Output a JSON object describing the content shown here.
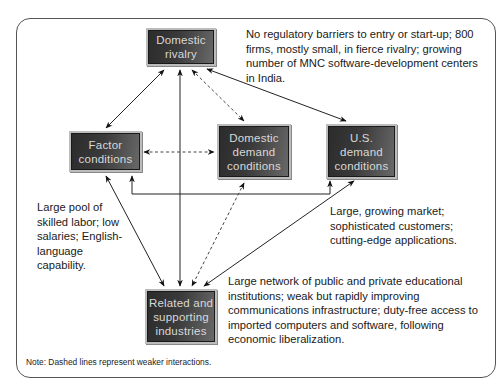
{
  "diagram": {
    "nodes": {
      "domestic_rivalry": "Domestic rivalry",
      "factor_conditions": "Factor conditions",
      "domestic_demand": "Domestic demand conditions",
      "us_demand": "U.S. demand conditions",
      "related_supporting": "Related and supporting industries"
    },
    "notes": {
      "rivalry": "No regulatory barriers to entry or start-up; 800 firms, mostly small, in fierce rivalry; growing number of MNC software-development centers in India.",
      "factor": "Large pool of skilled labor; low salaries; English-language capability.",
      "us_demand": "Large, growing market; sophisticated customers; cutting-edge applications.",
      "related": "Large network of public and private educational institutions; weak but rapidly improving communications infrastructure; duty-free access to imported computers and software, following economic liberalization."
    },
    "footnote": "Note: Dashed lines represent weaker interactions.",
    "edges": [
      {
        "from": "Domestic rivalry",
        "to": "Factor conditions",
        "style": "solid",
        "bidirectional": true
      },
      {
        "from": "Domestic rivalry",
        "to": "Related and supporting industries",
        "style": "solid",
        "bidirectional": true
      },
      {
        "from": "Domestic rivalry",
        "to": "Domestic demand conditions",
        "style": "dashed",
        "bidirectional": true
      },
      {
        "from": "Domestic rivalry",
        "to": "U.S. demand conditions",
        "style": "solid",
        "bidirectional": true
      },
      {
        "from": "Factor conditions",
        "to": "Domestic demand conditions",
        "style": "dashed",
        "bidirectional": true
      },
      {
        "from": "Factor conditions",
        "to": "U.S. demand conditions",
        "style": "solid",
        "bidirectional": true
      },
      {
        "from": "Factor conditions",
        "to": "Related and supporting industries",
        "style": "solid",
        "bidirectional": true
      },
      {
        "from": "Domestic demand conditions",
        "to": "Related and supporting industries",
        "style": "dashed",
        "bidirectional": true
      },
      {
        "from": "U.S. demand conditions",
        "to": "Related and supporting industries",
        "style": "solid",
        "bidirectional": true
      }
    ]
  }
}
